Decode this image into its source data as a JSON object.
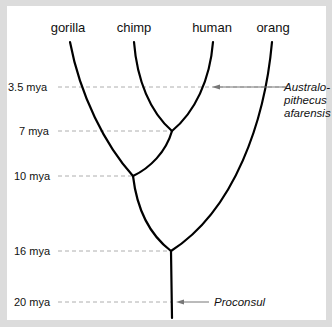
{
  "diagram": {
    "type": "phylogenetic-tree",
    "tips": [
      {
        "label": "gorilla"
      },
      {
        "label": "chimp"
      },
      {
        "label": "human"
      },
      {
        "label": "orang"
      }
    ],
    "time_axis": [
      {
        "label": "3.5 mya",
        "value_mya": 3.5
      },
      {
        "label": "7 mya",
        "value_mya": 7
      },
      {
        "label": "10 mya",
        "value_mya": 10
      },
      {
        "label": "16 mya",
        "value_mya": 16
      },
      {
        "label": "20 mya",
        "value_mya": 20
      }
    ],
    "divergences": [
      {
        "groups": [
          "chimp",
          "human"
        ],
        "time": "7 mya"
      },
      {
        "groups": [
          "gorilla",
          "chimp+human"
        ],
        "time": "10 mya"
      },
      {
        "groups": [
          "orang",
          "african apes"
        ],
        "time": "16 mya"
      }
    ],
    "annotations": {
      "australopithecus": {
        "line1": "Australo-",
        "line2": "pithecus",
        "line3": "afarensis",
        "time": "3.5 mya"
      },
      "proconsul": {
        "label": "Proconsul",
        "time": "20 mya"
      }
    }
  }
}
